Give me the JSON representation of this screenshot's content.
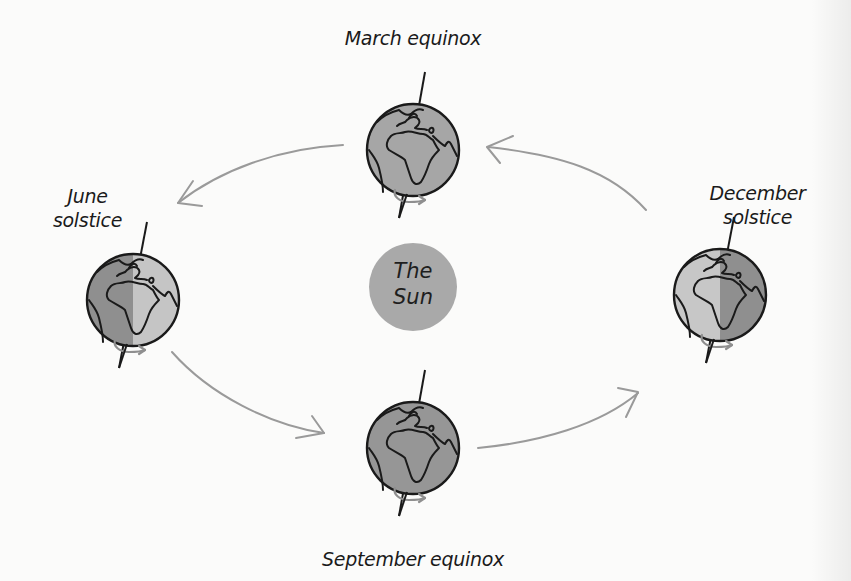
{
  "diagram": {
    "center": {
      "label_line1": "The",
      "label_line2": "Sun"
    },
    "positions": [
      {
        "id": "march",
        "label": "March equinox",
        "lines": [
          "March equinox"
        ],
        "illumination": "even"
      },
      {
        "id": "june",
        "label": "June solstice",
        "lines": [
          "June",
          "solstice"
        ],
        "illumination": "right-lit"
      },
      {
        "id": "september",
        "label": "September equinox",
        "lines": [
          "September equinox"
        ],
        "illumination": "even"
      },
      {
        "id": "december",
        "label": "December solstice",
        "lines": [
          "December",
          "solstice"
        ],
        "illumination": "left-lit"
      }
    ],
    "orbit_direction": "counterclockwise",
    "arrows": [
      {
        "from": "december",
        "to": "march"
      },
      {
        "from": "march",
        "to": "june"
      },
      {
        "from": "june",
        "to": "september"
      },
      {
        "from": "september",
        "to": "december"
      }
    ],
    "icons": {
      "globe": "earth-globe-icon",
      "rotation": "rotation-arrow-icon"
    }
  },
  "colors": {
    "background": "#fbfbfa",
    "sun_fill": "#a9a9a9",
    "globe_fill": "#a3a3a3",
    "globe_dark": "#8f8f8f",
    "globe_light": "#c4c4c4",
    "outline": "#1a1a1a",
    "arrow": "#9a9a9a"
  }
}
